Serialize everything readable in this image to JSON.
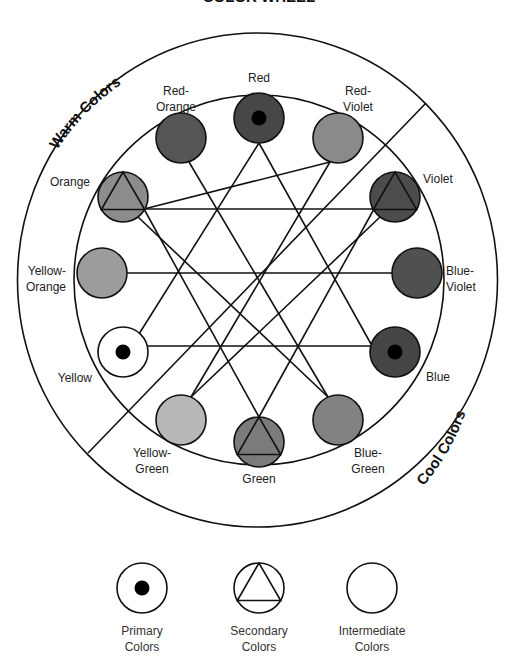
{
  "title": "COLOR WHEEL",
  "arc_labels": {
    "warm": "Warm Colors",
    "cool": "Cool Colors"
  },
  "colors": [
    {
      "name": "Red",
      "lines": [
        "Red"
      ],
      "type": "primary",
      "fill": "#474747",
      "cx": 259,
      "cy": 118
    },
    {
      "name": "Red-Violet",
      "lines": [
        "Red-",
        "Violet"
      ],
      "type": "intermediate",
      "fill": "#8a8a8a",
      "cx": 338,
      "cy": 138
    },
    {
      "name": "Violet",
      "lines": [
        "Violet"
      ],
      "type": "secondary",
      "fill": "#4c4c4c",
      "cx": 395,
      "cy": 197
    },
    {
      "name": "Blue-Violet",
      "lines": [
        "Blue-",
        "Violet"
      ],
      "type": "intermediate",
      "fill": "#505050",
      "cx": 417,
      "cy": 273
    },
    {
      "name": "Blue",
      "lines": [
        "Blue"
      ],
      "type": "primary",
      "fill": "#454545",
      "cx": 395,
      "cy": 352
    },
    {
      "name": "Blue-Green",
      "lines": [
        "Blue-",
        "Green"
      ],
      "type": "intermediate",
      "fill": "#828282",
      "cx": 338,
      "cy": 420
    },
    {
      "name": "Green",
      "lines": [
        "Green"
      ],
      "type": "secondary",
      "fill": "#7b7b7b",
      "cx": 259,
      "cy": 442
    },
    {
      "name": "Yellow-Green",
      "lines": [
        "Yellow-",
        "Green"
      ],
      "type": "intermediate",
      "fill": "#b8b8b8",
      "cx": 181,
      "cy": 420
    },
    {
      "name": "Yellow",
      "lines": [
        "Yellow"
      ],
      "type": "primary",
      "fill": "#ffffff",
      "cx": 123,
      "cy": 352
    },
    {
      "name": "Yellow-Orange",
      "lines": [
        "Yellow-",
        "Orange"
      ],
      "type": "intermediate",
      "fill": "#9c9c9c",
      "cx": 102,
      "cy": 273
    },
    {
      "name": "Orange",
      "lines": [
        "Orange"
      ],
      "type": "secondary",
      "fill": "#8c8c8c",
      "cx": 123,
      "cy": 197
    },
    {
      "name": "Red-Orange",
      "lines": [
        "Red-",
        "Orange"
      ],
      "type": "intermediate",
      "fill": "#555555",
      "cx": 181,
      "cy": 138
    }
  ],
  "legend": [
    {
      "type": "primary",
      "lines": [
        "Primary",
        "Colors"
      ]
    },
    {
      "type": "secondary",
      "lines": [
        "Secondary",
        "Colors"
      ]
    },
    {
      "type": "intermediate",
      "lines": [
        "Intermediate",
        "Colors"
      ]
    }
  ]
}
